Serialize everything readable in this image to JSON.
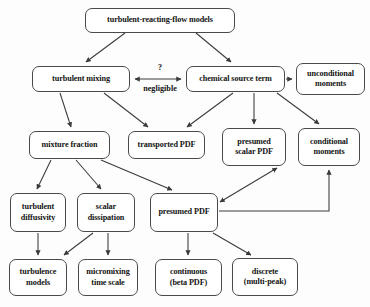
{
  "diagram": {
    "title": "turbulent-reacting-flow models",
    "background_color": "#fdfdfd",
    "line_color": "#3a3a3a",
    "text_color": "#141414",
    "nodes": [
      {
        "id": "root",
        "label": "turbulent-reacting-flow models",
        "x": 85,
        "y": 8,
        "w": 150,
        "h": 25
      },
      {
        "id": "mixing",
        "label": "turbulent mixing",
        "x": 32,
        "y": 66,
        "w": 98,
        "h": 26
      },
      {
        "id": "source",
        "label": "chemical source term",
        "x": 186,
        "y": 66,
        "w": 99,
        "h": 26
      },
      {
        "id": "uncond",
        "label": "unconditional\nmoments",
        "x": 296,
        "y": 63,
        "w": 69,
        "h": 32
      },
      {
        "id": "mixfrac",
        "label": "mixture fraction",
        "x": 29,
        "y": 131,
        "w": 81,
        "h": 28
      },
      {
        "id": "transported",
        "label": "transported PDF",
        "x": 128,
        "y": 131,
        "w": 77,
        "h": 28
      },
      {
        "id": "presumedsc",
        "label": "presumed\nscalar PDF",
        "x": 222,
        "y": 128,
        "w": 64,
        "h": 38
      },
      {
        "id": "condmom",
        "label": "conditional\nmoments",
        "x": 298,
        "y": 128,
        "w": 62,
        "h": 38
      },
      {
        "id": "turbdiff",
        "label": "turbulent\ndiffusivity",
        "x": 10,
        "y": 193,
        "w": 56,
        "h": 39
      },
      {
        "id": "scaldiss",
        "label": "scalar\ndissipation",
        "x": 77,
        "y": 193,
        "w": 58,
        "h": 39
      },
      {
        "id": "presumedpdf",
        "label": "presumed PDF",
        "x": 150,
        "y": 193,
        "w": 68,
        "h": 39
      },
      {
        "id": "turbmodels",
        "label": "turbulence\nmodels",
        "x": 9,
        "y": 259,
        "w": 58,
        "h": 37
      },
      {
        "id": "micromix",
        "label": "micromixing\ntime scale",
        "x": 78,
        "y": 259,
        "w": 60,
        "h": 37
      },
      {
        "id": "continuous",
        "label": "continuous\n(beta PDF)",
        "x": 155,
        "y": 259,
        "w": 67,
        "h": 37
      },
      {
        "id": "discrete",
        "label": "discrete\n(multi-peak)",
        "x": 232,
        "y": 258,
        "w": 66,
        "h": 38
      }
    ],
    "edge_labels": [
      {
        "id": "question",
        "label": "?",
        "x": 160,
        "y": 63
      },
      {
        "id": "negligible",
        "label": "negligible",
        "x": 160,
        "y": 84
      }
    ],
    "edges": [
      {
        "from": "root",
        "to": "mixing",
        "type": "single",
        "d": "M 125,33 L 86,62"
      },
      {
        "from": "root",
        "to": "source",
        "type": "single",
        "d": "M 196,33 L 231,62"
      },
      {
        "from": "mixing",
        "to": "source",
        "type": "double",
        "d": "M 135,79 L 181,79"
      },
      {
        "from": "source",
        "to": "uncond",
        "type": "single",
        "d": "M 286,79 L 292,79"
      },
      {
        "from": "mixing",
        "to": "mixfrac",
        "type": "single",
        "d": "M 60,93 L 71,127"
      },
      {
        "from": "mixing",
        "to": "transported",
        "type": "single",
        "d": "M 104,93 L 148,127"
      },
      {
        "from": "source",
        "to": "transported",
        "type": "single",
        "d": "M 233,93 L 187,127"
      },
      {
        "from": "source",
        "to": "presumedsc",
        "type": "single",
        "d": "M 254,93 L 254,124"
      },
      {
        "from": "source",
        "to": "condmom",
        "type": "single",
        "d": "M 277,93 L 319,124"
      },
      {
        "from": "mixfrac",
        "to": "turbdiff",
        "type": "single",
        "d": "M 51,160 L 37,189"
      },
      {
        "from": "mixfrac",
        "to": "scaldiss",
        "type": "single",
        "d": "M 76,160 L 101,189"
      },
      {
        "from": "mixfrac",
        "to": "presumedpdf",
        "type": "single",
        "d": "M 101,160 L 172,190"
      },
      {
        "from": "turbdiff",
        "to": "turbmodels",
        "type": "single",
        "d": "M 38,233 L 38,255"
      },
      {
        "from": "scaldiss",
        "to": "turbmodels",
        "type": "single",
        "d": "M 93,233 L 64,255"
      },
      {
        "from": "scaldiss",
        "to": "micromix",
        "type": "single",
        "d": "M 108,233 L 108,255"
      },
      {
        "from": "presumedpdf",
        "to": "continuous",
        "type": "single",
        "d": "M 188,233 L 188,255"
      },
      {
        "from": "presumedpdf",
        "to": "discrete",
        "type": "single",
        "d": "M 213,233 L 251,255"
      },
      {
        "from": "presumedpdf",
        "to": "presumedsc",
        "type": "double",
        "d": "M 220,202 L 277,168"
      },
      {
        "from": "presumedpdf",
        "to": "condmom",
        "type": "elbow",
        "d": "M 219,211 L 329,211 L 329,170"
      }
    ]
  }
}
